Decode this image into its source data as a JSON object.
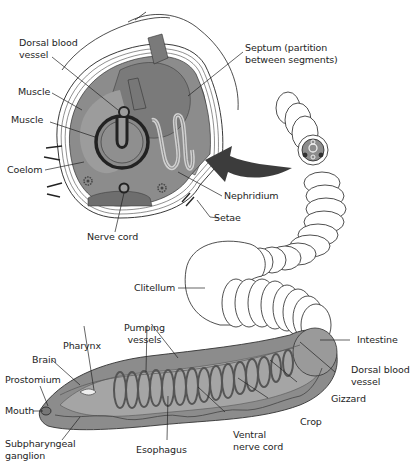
{
  "figure": {
    "colors": {
      "tissue_dark": "#6e6e6e",
      "tissue_mid": "#8c8c8c",
      "tissue_light": "#a9a9a9",
      "body_outline": "#222222",
      "arrow": "#3c3c3c",
      "background": "#ffffff"
    }
  },
  "cross_section": {
    "labels": {
      "dorsal_blood_vessel": "Dorsal blood\nvessel",
      "muscle_outer": "Muscle",
      "muscle_inner": "Muscle",
      "coelom": "Coelom",
      "nerve_cord": "Nerve cord",
      "septum": "Septum (partition\nbetween segments)",
      "nephridium": "Nephridium",
      "setae": "Setae"
    }
  },
  "body": {
    "labels": {
      "clitellum": "Clitellum",
      "pumping_vessels": "Pumping\nvessels",
      "pharynx": "Pharynx",
      "brain": "Brain",
      "prostomium": "Prostomium",
      "mouth": "Mouth",
      "subpharyngeal_ganglion": "Subpharyngeal\nganglion",
      "esophagus": "Esophagus",
      "ventral_nerve_cord": "Ventral\nnerve cord",
      "crop": "Crop",
      "gizzard": "Gizzard",
      "dorsal_blood_vessel": "Dorsal blood\nvessel",
      "intestine": "Intestine"
    }
  }
}
